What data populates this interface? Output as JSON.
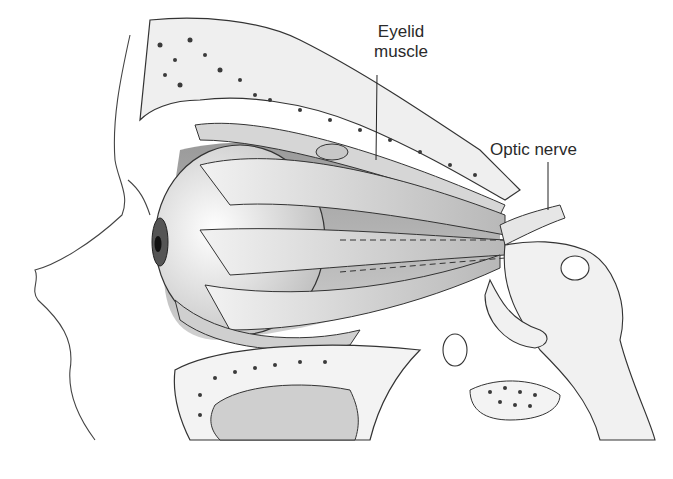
{
  "figure": {
    "labels": {
      "eyelid_muscle_line1": "Eyelid",
      "eyelid_muscle_line2": "muscle",
      "optic_nerve": "Optic nerve"
    },
    "colors": {
      "background": "#ffffff",
      "ink": "#2a2a2a",
      "bone": "#f4f4f4",
      "muscle": "#d8d8d8",
      "shadow": "#7a7a7a"
    }
  }
}
